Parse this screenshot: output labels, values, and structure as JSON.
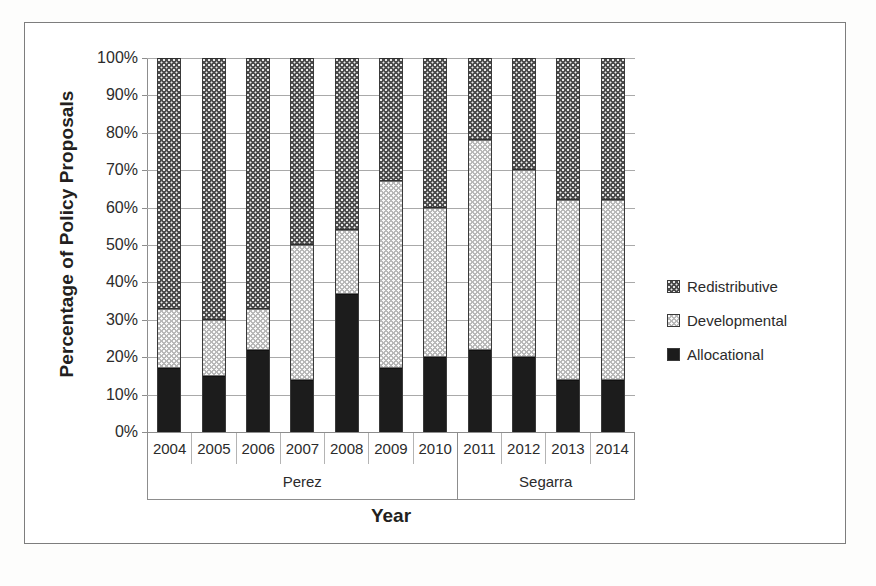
{
  "chart_data": {
    "type": "bar",
    "subtype": "stacked-percentage-column",
    "title": "",
    "xlabel": "Year",
    "ylabel": "Percentage of Policy Proposals",
    "ylim": [
      0,
      100
    ],
    "ytick_labels": [
      "0%",
      "10%",
      "20%",
      "30%",
      "40%",
      "50%",
      "60%",
      "70%",
      "80%",
      "90%",
      "100%"
    ],
    "ytick_values": [
      0,
      10,
      20,
      30,
      40,
      50,
      60,
      70,
      80,
      90,
      100
    ],
    "grid": true,
    "legend_position": "right",
    "categories": [
      "2004",
      "2005",
      "2006",
      "2007",
      "2008",
      "2009",
      "2010",
      "2011",
      "2012",
      "2013",
      "2014"
    ],
    "series": [
      {
        "name": "Allocational",
        "pattern": "solid-black",
        "color": "#1c1c1c",
        "values": [
          17,
          15,
          22,
          14,
          37,
          17,
          20,
          22,
          20,
          14,
          14
        ]
      },
      {
        "name": "Developmental",
        "pattern": "light-dotted",
        "color": "#b8b8b8",
        "values": [
          16,
          15,
          11,
          36,
          17,
          50,
          40,
          56,
          50,
          48,
          48
        ]
      },
      {
        "name": "Redistributive",
        "pattern": "dark-checkered",
        "color": "#4a4a4a",
        "values": [
          67,
          70,
          67,
          50,
          46,
          33,
          40,
          22,
          30,
          38,
          38
        ]
      }
    ],
    "stack_order_bottom_to_top": [
      "Allocational",
      "Developmental",
      "Redistributive"
    ],
    "legend_entries": [
      "Redistributive",
      "Developmental",
      "Allocational"
    ],
    "groups": [
      {
        "label": "Perez",
        "categories": [
          "2004",
          "2005",
          "2006",
          "2007",
          "2008",
          "2009",
          "2010"
        ],
        "span": 7
      },
      {
        "label": "Segarra",
        "categories": [
          "2011",
          "2012",
          "2013",
          "2014"
        ],
        "span": 4
      }
    ]
  },
  "caption": ""
}
